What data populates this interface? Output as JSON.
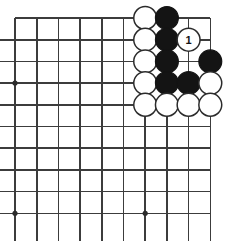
{
  "diagram": {
    "kind": "go-board-diagram",
    "board": {
      "columns": 10,
      "rows": 10,
      "origin_x": 15,
      "origin_y": 18,
      "spacing": 21.7,
      "line_color": "#3c3c3c",
      "background_color": "#ffffff",
      "edges": {
        "top": true,
        "left": false,
        "right": true,
        "bottom": false
      }
    },
    "star_points": [
      {
        "col": 0,
        "row": 3
      },
      {
        "col": 0,
        "row": 9
      },
      {
        "col": 6,
        "row": 9
      }
    ],
    "stones": [
      {
        "col": 6,
        "row": 0,
        "color": "white",
        "label": ""
      },
      {
        "col": 7,
        "row": 0,
        "color": "black",
        "label": ""
      },
      {
        "col": 6,
        "row": 1,
        "color": "white",
        "label": ""
      },
      {
        "col": 7,
        "row": 1,
        "color": "black",
        "label": ""
      },
      {
        "col": 8,
        "row": 1,
        "color": "white",
        "label": "1"
      },
      {
        "col": 6,
        "row": 2,
        "color": "white",
        "label": ""
      },
      {
        "col": 7,
        "row": 2,
        "color": "black",
        "label": ""
      },
      {
        "col": 9,
        "row": 2,
        "color": "black",
        "label": ""
      },
      {
        "col": 6,
        "row": 3,
        "color": "white",
        "label": ""
      },
      {
        "col": 7,
        "row": 3,
        "color": "black",
        "label": ""
      },
      {
        "col": 8,
        "row": 3,
        "color": "black",
        "label": ""
      },
      {
        "col": 9,
        "row": 3,
        "color": "white",
        "label": ""
      },
      {
        "col": 6,
        "row": 4,
        "color": "white",
        "label": ""
      },
      {
        "col": 7,
        "row": 4,
        "color": "white",
        "label": ""
      },
      {
        "col": 8,
        "row": 4,
        "color": "white",
        "label": ""
      },
      {
        "col": 9,
        "row": 4,
        "color": "white",
        "label": ""
      }
    ],
    "colors": {
      "black_stone": "#141414",
      "white_stone": "#ffffff",
      "stone_outline": "#2b2b2b",
      "grid": "#3c3c3c"
    }
  }
}
